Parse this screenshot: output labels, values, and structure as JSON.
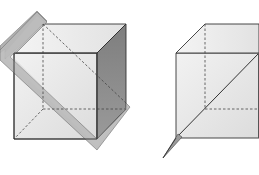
{
  "figure": {
    "colors": {
      "background": "#ffffff",
      "face_light": "#ececec",
      "face_front": "#e4e4e4",
      "face_top": "#efefef",
      "face_side_dark": "#8e8e8e",
      "plane_fill": "#b8b8b8",
      "edge": "#333333",
      "hidden_edge": "#444444"
    },
    "left_cube": {
      "label": "cube-with-plane",
      "vertices": {
        "front_top_left": [
          14,
          53
        ],
        "front_top_right": [
          97,
          53
        ],
        "front_bottom_left": [
          14,
          139
        ],
        "front_bottom_right": [
          97,
          139
        ],
        "back_top_left": [
          43,
          24
        ],
        "back_top_right": [
          126,
          24
        ],
        "back_bottom_left": [
          43,
          109
        ],
        "back_bottom_right": [
          126,
          109
        ]
      }
    },
    "right_cube": {
      "label": "cube-with-diagonal-section",
      "vertices": {
        "front_top_left": [
          176,
          53
        ],
        "front_top_right": [
          259,
          53
        ],
        "front_bottom_left": [
          176,
          138
        ],
        "front_bottom_right": [
          259,
          138
        ],
        "back_top_left": [
          205,
          24
        ],
        "back_top_right": [
          259,
          24
        ],
        "back_bottom_left": [
          205,
          109
        ]
      }
    }
  }
}
